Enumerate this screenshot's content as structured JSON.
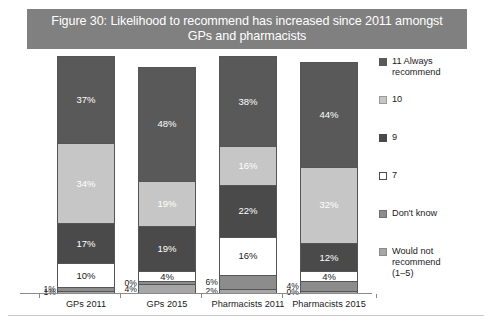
{
  "title": {
    "line1": "Figure 30: Likelihood to recommend has increased since 2011 amongst",
    "line2": "GPs and pharmacists"
  },
  "colors": {
    "title_bar": "#808080",
    "always_recommend_11": "#595959",
    "ten": "#c6c6c6",
    "nine": "#4a4a4a",
    "seven": "#ffffff",
    "dont_know": "#8c8c8c",
    "would_not_recommend": "#a6a6a6",
    "axis": "#8a8a8a"
  },
  "legend": {
    "items": [
      {
        "label": "11 Always\nrecommend",
        "key": "always_recommend_11",
        "swatch": "#595959",
        "border": "#595959"
      },
      {
        "label": "10",
        "key": "ten",
        "swatch": "#c6c6c6",
        "border": "#9a9a9a"
      },
      {
        "label": "9",
        "key": "nine",
        "swatch": "#4a4a4a",
        "border": "#4a4a4a"
      },
      {
        "label": "7",
        "key": "seven",
        "swatch": "#ffffff",
        "border": "#4a4a4a"
      },
      {
        "label": "Don't know",
        "key": "dont_know",
        "swatch": "#8c8c8c",
        "border": "#6f6f6f"
      },
      {
        "label": "Would not\nrecommend\n(1–5)",
        "key": "would_not_recommend",
        "swatch": "#a6a6a6",
        "border": "#8a8a8a"
      }
    ]
  },
  "chart_data": {
    "type": "bar",
    "subtype": "stacked-100-percent",
    "title": "Figure 30: Likelihood to recommend has increased since 2011 amongst GPs and pharmacists",
    "xlabel": "",
    "ylabel": "",
    "ylim": [
      0,
      100
    ],
    "grid": false,
    "legend_position": "right",
    "value_suffix": "%",
    "categories": [
      "GPs 2011",
      "GPs 2015",
      "Pharmacists 2011",
      "Pharmacists 2015"
    ],
    "stack_order_bottom_to_top": [
      "Would not recommend (1–5)",
      "Don't know",
      "7",
      "9",
      "10",
      "11 Always recommend"
    ],
    "series": [
      {
        "name": "11 Always recommend",
        "key": "always_recommend_11",
        "values": [
          37,
          48,
          38,
          44
        ],
        "labels": [
          "37%",
          "48%",
          "38%",
          "44%"
        ]
      },
      {
        "name": "10",
        "key": "ten",
        "values": [
          34,
          19,
          16,
          32
        ],
        "labels": [
          "34%",
          "19%",
          "16%",
          "32%"
        ]
      },
      {
        "name": "9",
        "key": "nine",
        "values": [
          17,
          19,
          22,
          12
        ],
        "labels": [
          "17%",
          "19%",
          "22%",
          "12%"
        ]
      },
      {
        "name": "7",
        "key": "seven",
        "values": [
          10,
          4,
          16,
          4
        ],
        "labels": [
          "10%",
          "4%",
          "16%",
          "4%"
        ]
      },
      {
        "name": "Don't know",
        "key": "dont_know",
        "values": [
          1,
          0,
          6,
          4
        ],
        "labels": [
          "1%",
          "0%",
          "6%",
          "4%"
        ]
      },
      {
        "name": "Would not recommend (1–5)",
        "key": "would_not_recommend",
        "values": [
          1,
          4,
          2,
          0
        ],
        "labels": [
          "1%",
          "4%",
          "2%",
          "0%"
        ]
      }
    ]
  },
  "bars": [
    {
      "category": "GPs 2011",
      "segments": [
        {
          "key": "always_recommend_11",
          "value": 37,
          "label": "37%",
          "label_position": "inside",
          "text_tone": "on-dark"
        },
        {
          "key": "ten",
          "value": 34,
          "label": "34%",
          "label_position": "inside",
          "text_tone": "on-light"
        },
        {
          "key": "nine",
          "value": 17,
          "label": "17%",
          "label_position": "inside",
          "text_tone": "on-dark"
        },
        {
          "key": "seven",
          "value": 10,
          "label": "10%",
          "label_position": "inside",
          "text_tone": "on-white"
        },
        {
          "key": "dont_know",
          "value": 1,
          "label": "1%",
          "label_position": "outside-left",
          "text_tone": "on-white"
        },
        {
          "key": "would_not_recommend",
          "value": 1,
          "label": "1%",
          "label_position": "outside-left",
          "text_tone": "on-white"
        }
      ]
    },
    {
      "category": "GPs 2015",
      "segments": [
        {
          "key": "always_recommend_11",
          "value": 48,
          "label": "48%",
          "label_position": "inside",
          "text_tone": "on-dark"
        },
        {
          "key": "ten",
          "value": 19,
          "label": "19%",
          "label_position": "inside",
          "text_tone": "on-light"
        },
        {
          "key": "nine",
          "value": 19,
          "label": "19%",
          "label_position": "inside",
          "text_tone": "on-dark"
        },
        {
          "key": "seven",
          "value": 4,
          "label": "4%",
          "label_position": "inside",
          "text_tone": "on-white"
        },
        {
          "key": "dont_know",
          "value": 0,
          "label": "0%",
          "label_position": "outside-left",
          "text_tone": "on-white"
        },
        {
          "key": "would_not_recommend",
          "value": 4,
          "label": "4%",
          "label_position": "outside-left",
          "text_tone": "on-white"
        }
      ]
    },
    {
      "category": "Pharmacists 2011",
      "segments": [
        {
          "key": "always_recommend_11",
          "value": 38,
          "label": "38%",
          "label_position": "inside",
          "text_tone": "on-dark"
        },
        {
          "key": "ten",
          "value": 16,
          "label": "16%",
          "label_position": "inside",
          "text_tone": "on-light"
        },
        {
          "key": "nine",
          "value": 22,
          "label": "22%",
          "label_position": "inside",
          "text_tone": "on-dark"
        },
        {
          "key": "seven",
          "value": 16,
          "label": "16%",
          "label_position": "inside",
          "text_tone": "on-white"
        },
        {
          "key": "dont_know",
          "value": 6,
          "label": "6%",
          "label_position": "outside-left",
          "text_tone": "on-white"
        },
        {
          "key": "would_not_recommend",
          "value": 2,
          "label": "2%",
          "label_position": "outside-left",
          "text_tone": "on-white"
        }
      ]
    },
    {
      "category": "Pharmacists 2015",
      "segments": [
        {
          "key": "always_recommend_11",
          "value": 44,
          "label": "44%",
          "label_position": "inside",
          "text_tone": "on-dark"
        },
        {
          "key": "ten",
          "value": 32,
          "label": "32%",
          "label_position": "inside",
          "text_tone": "on-light"
        },
        {
          "key": "nine",
          "value": 12,
          "label": "12%",
          "label_position": "inside",
          "text_tone": "on-dark"
        },
        {
          "key": "seven",
          "value": 4,
          "label": "4%",
          "label_position": "inside",
          "text_tone": "on-white"
        },
        {
          "key": "dont_know",
          "value": 4,
          "label": "4%",
          "label_position": "outside-left",
          "text_tone": "on-white"
        },
        {
          "key": "would_not_recommend",
          "value": 0,
          "label": "0%",
          "label_position": "outside-left",
          "text_tone": "on-white"
        }
      ]
    }
  ],
  "source_note": ""
}
